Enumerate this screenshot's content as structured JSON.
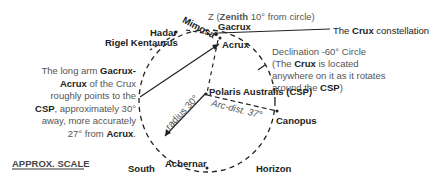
{
  "diagram": {
    "zenith": {
      "prefix": "Z (",
      "bold": "Zenith",
      "suffix": " 10° from circle)"
    },
    "stars": {
      "gacrux": "Gacrux",
      "mimosa": "Mimosa",
      "hadar": "Hadar",
      "rigel_kentaurus": "Rigel Kentaurus",
      "acrux": "Acrux",
      "polaris_australis": "Polaris Australis (CSP)",
      "canopus": "Canopus",
      "achernar": "Achernar"
    },
    "crux_label": {
      "prefix": "The ",
      "bold": "Crux",
      "suffix": " constellation"
    },
    "declination_note": {
      "line1": "Declination -60° Circle",
      "line2_prefix": "(The ",
      "line2_bold": "Crux",
      "line2_suffix": " is located",
      "line3": "anywhere on it as it rotates",
      "line4_prefix": "around the ",
      "line4_bold": "CSP",
      "line4_suffix": ")"
    },
    "long_arm_note": {
      "line1_prefix": "The long arm ",
      "line1_bold": "Gacrux-",
      "line2_bold": "Acrux",
      "line2_suffix": " of the Crux",
      "line3": "roughly points to the",
      "line4_bold": "CSP",
      "line4_suffix": ", approximately 30°",
      "line5": "away, more accurately",
      "line6_prefix": "27° from ",
      "line6_bold": "Acrux",
      "line6_suffix": "."
    },
    "radius_label": "radius 30°",
    "arc_label": "Arc-dist. 37°",
    "scale_label": "APPROX. SCALE",
    "south_label": "South",
    "horizon_label": "Horizon"
  }
}
